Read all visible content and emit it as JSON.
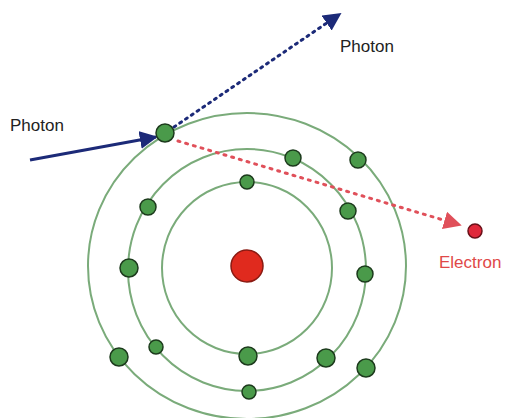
{
  "labels": {
    "incoming_photon": "Photon",
    "scattered_photon": "Photon",
    "ejected_electron": "Electron"
  },
  "colors": {
    "orbit": "#7aab7a",
    "electron_fill": "#4a9a4a",
    "electron_stroke": "#1c3a1c",
    "nucleus": "#e02a1e",
    "photon": "#1c2a78",
    "ejected": "#e0505a",
    "label_text": "#222222",
    "electron_label": "#e04848"
  },
  "atom": {
    "nucleus": {
      "cx": 247,
      "cy": 266,
      "r": 16
    },
    "orbits": [
      {
        "name": "inner",
        "cx": 247,
        "cy": 268,
        "rx": 85,
        "ry": 86
      },
      {
        "name": "middle",
        "cx": 247,
        "cy": 270,
        "rx": 119,
        "ry": 121
      },
      {
        "name": "outer",
        "cx": 247,
        "cy": 266,
        "rx": 159,
        "ry": 153
      }
    ],
    "electrons": [
      {
        "cx": 165,
        "cy": 133,
        "r": 9
      },
      {
        "cx": 358,
        "cy": 160,
        "r": 8
      },
      {
        "cx": 119,
        "cy": 357,
        "r": 9
      },
      {
        "cx": 366,
        "cy": 368,
        "r": 9
      },
      {
        "cx": 148,
        "cy": 207,
        "r": 8
      },
      {
        "cx": 293,
        "cy": 158,
        "r": 8
      },
      {
        "cx": 129,
        "cy": 268,
        "r": 9
      },
      {
        "cx": 348,
        "cy": 211,
        "r": 8
      },
      {
        "cx": 365,
        "cy": 274,
        "r": 8
      },
      {
        "cx": 156,
        "cy": 347,
        "r": 7
      },
      {
        "cx": 326,
        "cy": 358,
        "r": 9
      },
      {
        "cx": 249,
        "cy": 392,
        "r": 7
      },
      {
        "cx": 247,
        "cy": 182,
        "r": 7
      },
      {
        "cx": 248,
        "cy": 356,
        "r": 9
      }
    ]
  }
}
